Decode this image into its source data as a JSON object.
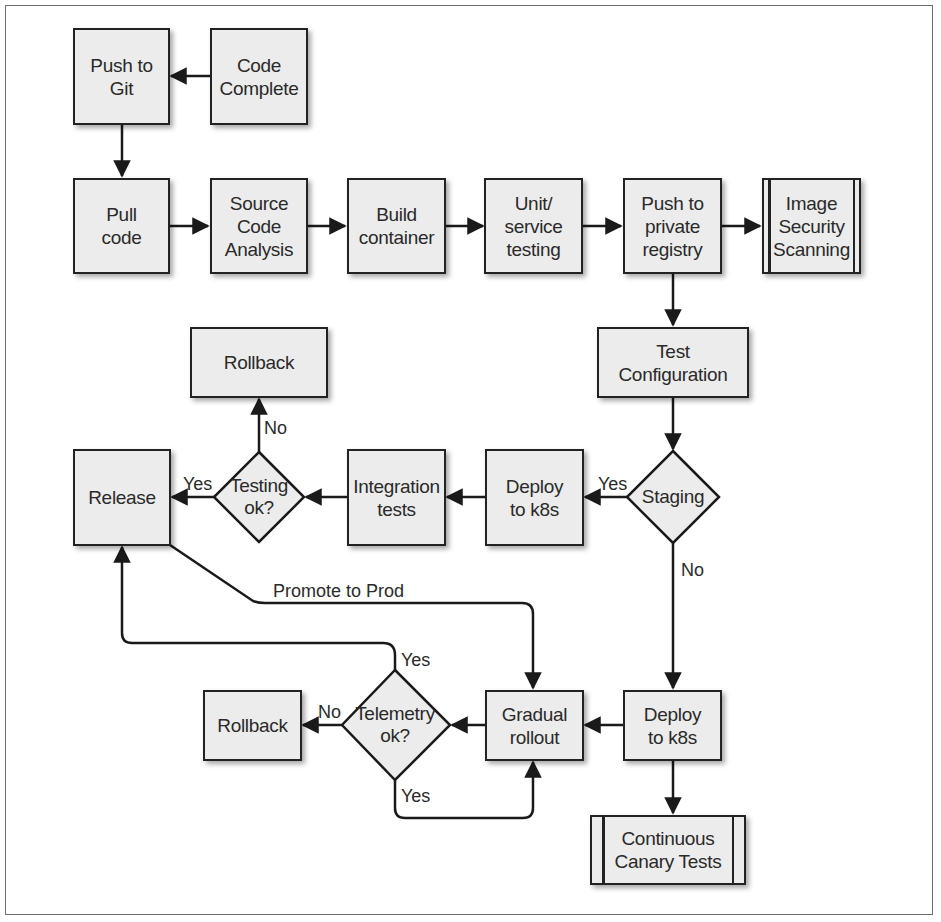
{
  "diagram": {
    "type": "flowchart",
    "title": "",
    "nodes": {
      "code_complete": "Code\nComplete",
      "push_to_git": "Push to\nGit",
      "pull_code": "Pull\ncode",
      "source_code_analysis": "Source\nCode\nAnalysis",
      "build_container": "Build\ncontainer",
      "unit_service_testing": "Unit/\nservice\ntesting",
      "push_private_registry": "Push to\nprivate\nregistry",
      "image_security_scanning": "Image\nSecurity\nScanning",
      "test_configuration": "Test\nConfiguration",
      "staging": "Staging",
      "deploy_k8s_staging": "Deploy\nto k8s",
      "integration_tests": "Integration\ntests",
      "testing_ok": "Testing\nok?",
      "rollback_top": "Rollback",
      "release": "Release",
      "deploy_k8s_prod": "Deploy\nto k8s",
      "gradual_rollout": "Gradual\nrollout",
      "telemetry_ok": "Telemetry\nok?",
      "rollback_bottom": "Rollback",
      "continuous_canary_tests": "Continuous\nCanary Tests"
    },
    "edge_labels": {
      "staging_yes": "Yes",
      "staging_no": "No",
      "testing_yes": "Yes",
      "testing_no": "No",
      "promote_to_prod": "Promote to Prod",
      "telemetry_yes_top": "Yes",
      "telemetry_no": "No",
      "telemetry_yes_bottom": "Yes"
    },
    "edges": [
      {
        "from": "Code Complete",
        "to": "Push to Git"
      },
      {
        "from": "Push to Git",
        "to": "Pull code"
      },
      {
        "from": "Pull code",
        "to": "Source Code Analysis"
      },
      {
        "from": "Source Code Analysis",
        "to": "Build container"
      },
      {
        "from": "Build container",
        "to": "Unit/service testing"
      },
      {
        "from": "Unit/service testing",
        "to": "Push to private registry"
      },
      {
        "from": "Push to private registry",
        "to": "Image Security Scanning"
      },
      {
        "from": "Push to private registry",
        "to": "Test Configuration"
      },
      {
        "from": "Test Configuration",
        "to": "Staging"
      },
      {
        "from": "Staging",
        "to": "Deploy to k8s (staging)",
        "label": "Yes"
      },
      {
        "from": "Staging",
        "to": "Deploy to k8s (prod)",
        "label": "No"
      },
      {
        "from": "Deploy to k8s (staging)",
        "to": "Integration tests"
      },
      {
        "from": "Integration tests",
        "to": "Testing ok?"
      },
      {
        "from": "Testing ok?",
        "to": "Release",
        "label": "Yes"
      },
      {
        "from": "Testing ok?",
        "to": "Rollback",
        "label": "No"
      },
      {
        "from": "Release",
        "to": "Gradual rollout",
        "label": "Promote to Prod"
      },
      {
        "from": "Deploy to k8s (prod)",
        "to": "Gradual rollout"
      },
      {
        "from": "Deploy to k8s (prod)",
        "to": "Continuous Canary Tests"
      },
      {
        "from": "Gradual rollout",
        "to": "Telemetry ok?"
      },
      {
        "from": "Telemetry ok?",
        "to": "Release",
        "label": "Yes"
      },
      {
        "from": "Telemetry ok?",
        "to": "Rollback",
        "label": "No"
      },
      {
        "from": "Telemetry ok?",
        "to": "Gradual rollout",
        "label": "Yes"
      }
    ],
    "colors": {
      "node_fill": "#ececec",
      "stroke": "#222222",
      "text": "#2a2a2a",
      "frame": "#6e6e6e"
    }
  }
}
